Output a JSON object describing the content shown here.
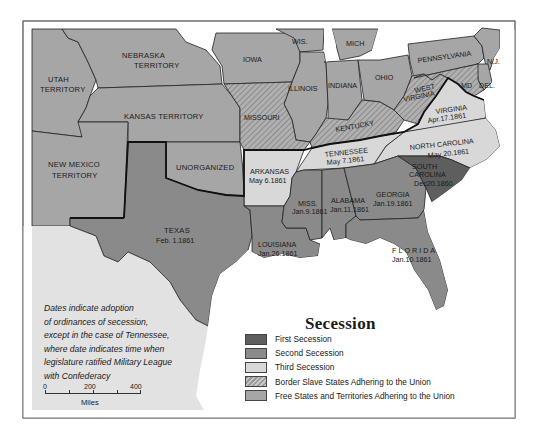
{
  "legend": {
    "title": "Secession",
    "items": [
      {
        "label": "First Secession",
        "color": "#5e5e5e",
        "pattern": "solid"
      },
      {
        "label": "Second Secession",
        "color": "#8a8a8a",
        "pattern": "solid"
      },
      {
        "label": "Third Secession",
        "color": "#d8d8d8",
        "pattern": "solid"
      },
      {
        "label": "Border Slave States Adhering to the Union",
        "color": "#a8a8a8",
        "pattern": "hatched"
      },
      {
        "label": "Free States and Territories Adhering to the Union",
        "color": "#a6a6a6",
        "pattern": "solid"
      }
    ]
  },
  "note": {
    "lines": [
      "Dates indicate adoption",
      "of ordinances of secession,",
      "except in the case of Tennessee,",
      "where date indicates time when",
      "legislature ratified Military League",
      "with Confederacy"
    ]
  },
  "scale": {
    "ticks": [
      "0",
      "200",
      "400"
    ],
    "unit": "Miles"
  },
  "regions": {
    "nebraska": {
      "name1": "NEBRASKA",
      "name2": "TERRITORY"
    },
    "utah": {
      "name1": "UTAH",
      "name2": "TERRITORY"
    },
    "kansas": {
      "name": "KANSAS  TERRITORY"
    },
    "new_mexico": {
      "name1": "NEW MEXICO",
      "name2": "TERRITORY"
    },
    "unorganized": {
      "name": "UNORGANIZED"
    },
    "iowa": {
      "name": "IOWA"
    },
    "wis": {
      "name": "WIS."
    },
    "mich": {
      "name": "MICH"
    },
    "illinois": {
      "name": "ILLINOIS"
    },
    "indiana": {
      "name": "INDIANA"
    },
    "ohio": {
      "name": "OHIO"
    },
    "pennsylvania": {
      "name": "PENNSYLVANIA"
    },
    "nj": {
      "name": "N.J."
    },
    "md": {
      "name": "MD"
    },
    "del": {
      "name": "DEL."
    },
    "missouri": {
      "name": "MISSOURI"
    },
    "kentucky": {
      "name": "KENTUCKY"
    },
    "west_virginia": {
      "name1": "WEST",
      "name2": "VIRGINIA"
    },
    "virginia": {
      "name": "VIRGINIA",
      "date": "Apr.17.1861"
    },
    "north_carolina": {
      "name": "NORTH CAROLINA",
      "date": "May 20.1861"
    },
    "tennessee": {
      "name": "TENNESSEE",
      "date": "May 7.1861"
    },
    "arkansas": {
      "name": "ARKANSAS",
      "date": "May 6.1861"
    },
    "south_carolina": {
      "name1": "SOUTH",
      "name2": "CAROLINA",
      "date": "Dec20.1860"
    },
    "georgia": {
      "name": "GEORGIA",
      "date": "Jan.19.1861"
    },
    "alabama": {
      "name": "ALABAMA",
      "date": "Jan.11.1861"
    },
    "mississippi": {
      "name": "MISS.",
      "date": "Jan.9.1861"
    },
    "louisiana": {
      "name": "LOUISIANA",
      "date": "Jan.26.1861"
    },
    "florida": {
      "name": "FLORIDA",
      "date": "Jan.10.1861"
    },
    "texas": {
      "name": "TEXAS",
      "date": "Feb. 1.1861"
    }
  }
}
